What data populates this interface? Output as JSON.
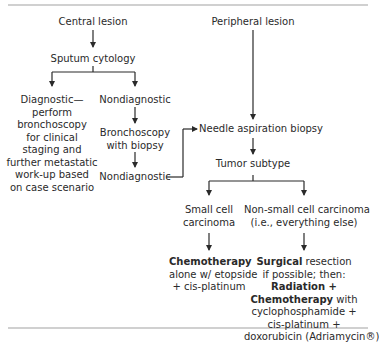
{
  "diagram": {
    "type": "flowchart",
    "nodes": {
      "central_lesion": "Central lesion",
      "sputum_cytology": "Sputum cytology",
      "diagnostic": [
        "Diagnostic—",
        "perform",
        "bronchoscopy",
        "for clinical",
        "staging and",
        "further metastatic",
        "work-up based",
        "on case scenario"
      ],
      "nondiagnostic_1": "Nondiagnostic",
      "bronchoscopy_biopsy": [
        "Bronchoscopy",
        "with biopsy"
      ],
      "nondiagnostic_2": "Nondiagnostic",
      "peripheral_lesion": "Peripheral lesion",
      "needle_biopsy": "Needle aspiration biopsy",
      "tumor_subtype": "Tumor subtype",
      "small_cell": [
        "Small cell",
        "carcinoma"
      ],
      "non_small_cell": [
        "Non-small cell carcinoma",
        "(i.e., everything else)"
      ],
      "small_cell_tx": {
        "bold": "Chemotherapy",
        "lines": [
          "alone w/ etopside",
          "+ cis-platinum"
        ]
      },
      "nsc_tx": {
        "l1_bold": "Surgical",
        "l1_rest": " resection",
        "l2": "if possible; then:",
        "l3_bold": "Radiation +",
        "l4_bold": "Chemotherapy",
        "l4_rest": " with",
        "l5": "cyclophosphamide +",
        "l6": "cis-platinum +",
        "l7": "doxorubicin (Adriamycin®)"
      }
    },
    "edges": [
      [
        "central_lesion",
        "sputum_cytology"
      ],
      [
        "sputum_cytology",
        "diagnostic"
      ],
      [
        "sputum_cytology",
        "nondiagnostic_1"
      ],
      [
        "nondiagnostic_1",
        "bronchoscopy_biopsy"
      ],
      [
        "bronchoscopy_biopsy",
        "nondiagnostic_2"
      ],
      [
        "nondiagnostic_2",
        "needle_biopsy"
      ],
      [
        "peripheral_lesion",
        "needle_biopsy"
      ],
      [
        "needle_biopsy",
        "tumor_subtype"
      ],
      [
        "tumor_subtype",
        "small_cell"
      ],
      [
        "tumor_subtype",
        "non_small_cell"
      ],
      [
        "small_cell",
        "small_cell_tx"
      ],
      [
        "non_small_cell",
        "nsc_tx"
      ]
    ],
    "colors": {
      "text": "#2a2a2a",
      "line": "#2a2a2a",
      "rule": "#d0d0d0"
    }
  }
}
